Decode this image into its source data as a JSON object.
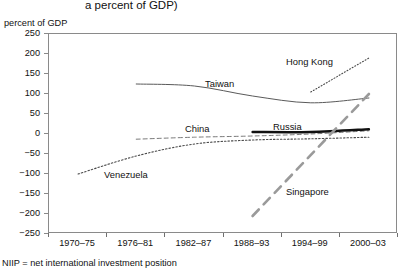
{
  "figure": {
    "title_fragment": "a percent of GDP)",
    "axis_title": "percent of GDP",
    "footnote": "NIIP  =  net international investment position"
  },
  "chart_data": {
    "type": "line",
    "title": "a percent of GDP)",
    "xlabel": "",
    "ylabel": "percent of GDP",
    "ylim": [
      -250,
      250
    ],
    "ytick_labels": [
      "250",
      "200",
      "150",
      "100",
      "50",
      "0",
      "-50",
      "-100",
      "-150",
      "-200",
      "-250"
    ],
    "ytick_values": [
      250,
      200,
      150,
      100,
      50,
      0,
      -50,
      -100,
      -150,
      -200,
      -250
    ],
    "grid": false,
    "legend": "inline-labels",
    "categories": [
      "1970–75",
      "1976–81",
      "1982–87",
      "1988–93",
      "1994–99",
      "2000–03"
    ],
    "series": [
      {
        "name": "Taiwan",
        "style": "thin-solid",
        "color": "#5a5a5a",
        "x": [
          "1976–81",
          "1982–87",
          "1988–93",
          "1994–99",
          "2000–03"
        ],
        "values": [
          125,
          120,
          95,
          78,
          90
        ]
      },
      {
        "name": "Hong Kong",
        "style": "fine-dotted",
        "color": "#4a4a4a",
        "x": [
          "1994–99",
          "2000–03"
        ],
        "values": [
          105,
          190
        ]
      },
      {
        "name": "China",
        "style": "dashed",
        "color": "#7a7a7a",
        "x": [
          "1976–81",
          "1982–87",
          "1988–93",
          "1994–99",
          "2000–03"
        ],
        "values": [
          -13,
          -8,
          -5,
          0,
          8
        ]
      },
      {
        "name": "Russia",
        "style": "thick-solid",
        "color": "#111111",
        "x": [
          "1988–93",
          "1994–99",
          "2000–03"
        ],
        "values": [
          5,
          5,
          12
        ]
      },
      {
        "name": "Venezuela",
        "style": "dotted",
        "color": "#4a4a4a",
        "x": [
          "1970–75",
          "1976–81",
          "1982–87",
          "1988–93",
          "1994–99",
          "2000–03"
        ],
        "values": [
          -100,
          -55,
          -25,
          -15,
          -12,
          -8
        ]
      },
      {
        "name": "Singapore",
        "style": "thick-dashed",
        "color": "#9a9a9a",
        "x": [
          "1988–93",
          "2000–03"
        ],
        "values": [
          -205,
          100
        ]
      }
    ],
    "annotations": [
      {
        "text": "Taiwan",
        "x": 205,
        "y": 78
      },
      {
        "text": "Hong Kong",
        "x": 286,
        "y": 56
      },
      {
        "text": "China",
        "x": 185,
        "y": 123
      },
      {
        "text": "Russia",
        "x": 273,
        "y": 121
      },
      {
        "text": "Venezuela",
        "x": 104,
        "y": 169
      },
      {
        "text": "Singapore",
        "x": 286,
        "y": 186
      }
    ]
  }
}
